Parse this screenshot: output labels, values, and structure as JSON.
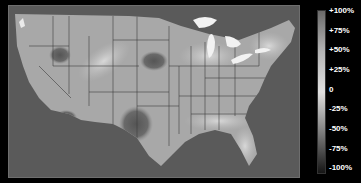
{
  "map": {
    "title": "",
    "region": "Contiguous United States",
    "palette": {
      "ocean": "#5a5a5a",
      "land_base": "#a8a8a8",
      "state_border": "#3c3c3c",
      "lakes": "#f2f2f2"
    },
    "anomalies": [
      {
        "name": "great-basin-deficit",
        "value_hint": "-50%"
      },
      {
        "name": "southwest-texas-deficit",
        "value_hint": "-50%"
      },
      {
        "name": "southern-california-deficit",
        "value_hint": "-50%"
      },
      {
        "name": "central-plains-deficit",
        "value_hint": "-25%"
      },
      {
        "name": "florida-gulf-surplus",
        "value_hint": "+50%"
      }
    ]
  },
  "legend": {
    "type": "vertical-colorbar",
    "colors": {
      "top": "#6a6a6a",
      "mid_high": "#b5b5b5",
      "center": "#e0e0e0",
      "mid_low": "#8a8a8a",
      "bottom": "#151515"
    },
    "ticks": [
      {
        "label": "+100%",
        "y": 10
      },
      {
        "label": "+75%",
        "y": 30
      },
      {
        "label": "+50%",
        "y": 49
      },
      {
        "label": "+25%",
        "y": 69
      },
      {
        "label": "0",
        "y": 89
      },
      {
        "label": "-25%",
        "y": 108
      },
      {
        "label": "-50%",
        "y": 128
      },
      {
        "label": "-75%",
        "y": 148
      },
      {
        "label": "-100%",
        "y": 167
      }
    ]
  }
}
